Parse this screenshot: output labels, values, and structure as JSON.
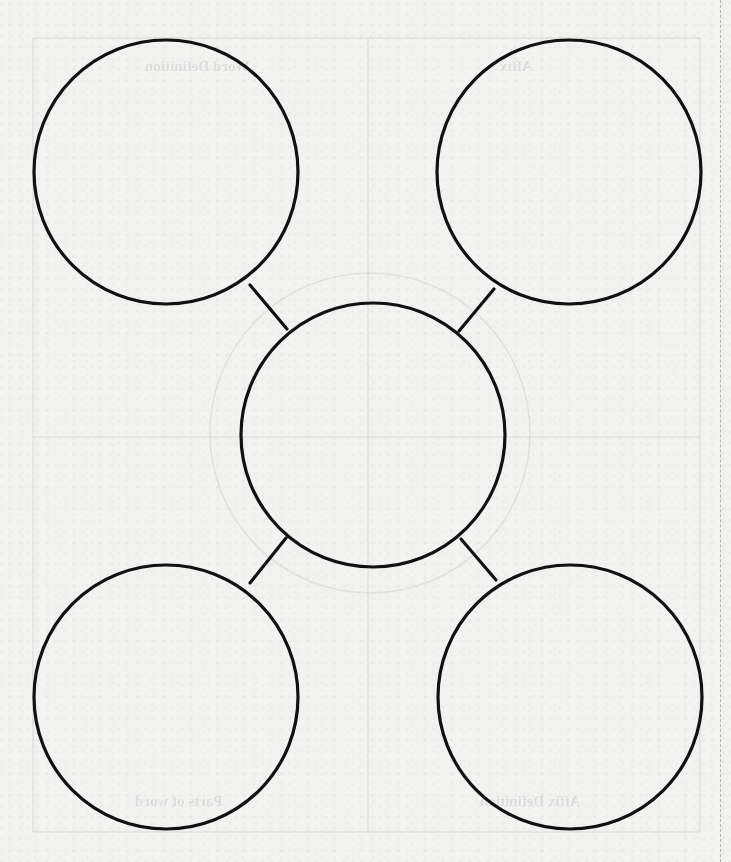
{
  "document": {
    "type": "graphic-organizer",
    "layout": "central circle connected to four corner circles"
  },
  "colors": {
    "paper": "#f2f2f0",
    "ink": "#111111",
    "bleed_through": "#d6d6d4"
  },
  "bleed_through_labels": {
    "top_left": "Word Definition",
    "top_right": "Affix",
    "bottom_left": "Parts of word",
    "bottom_right": "Affix Definition"
  },
  "circles": [
    {
      "id": "top-left",
      "cx": 166,
      "cy": 172,
      "r": 132,
      "text": ""
    },
    {
      "id": "top-right",
      "cx": 569,
      "cy": 172,
      "r": 132,
      "text": ""
    },
    {
      "id": "center",
      "cx": 373,
      "cy": 435,
      "r": 132,
      "text": ""
    },
    {
      "id": "bottom-left",
      "cx": 166,
      "cy": 697,
      "r": 132,
      "text": ""
    },
    {
      "id": "bottom-right",
      "cx": 570,
      "cy": 697,
      "r": 132,
      "text": ""
    }
  ]
}
